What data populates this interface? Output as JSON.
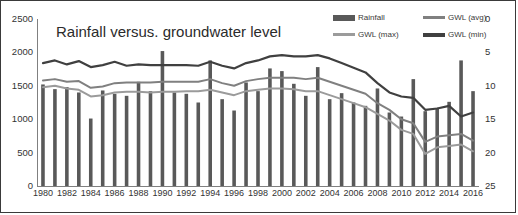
{
  "chart_data": {
    "type": "bar",
    "title": "Rainfall versus. groundwater level",
    "xlabel": "",
    "ylabel": "",
    "ylim": [
      0,
      2500
    ],
    "y2lim": [
      0,
      25
    ],
    "y2_inverted": true,
    "grid": false,
    "legend_position": "top-right",
    "y_ticks": [
      "0",
      "500",
      "1000",
      "1500",
      "2000",
      "2500"
    ],
    "y2_ticks": [
      "0",
      "5",
      "10",
      "15",
      "20",
      "25"
    ],
    "categories": [
      "1980",
      "1981",
      "1982",
      "1983",
      "1984",
      "1985",
      "1986",
      "1987",
      "1988",
      "1989",
      "1990",
      "1991",
      "1992",
      "1993",
      "1994",
      "1995",
      "1996",
      "1997",
      "1998",
      "1999",
      "2000",
      "2001",
      "2002",
      "2003",
      "2004",
      "2005",
      "2006",
      "2007",
      "2008",
      "2009",
      "2010",
      "2011",
      "2012",
      "2013",
      "2014",
      "2015",
      "2016"
    ],
    "tick_labels": [
      "1980",
      "1982",
      "1984",
      "1986",
      "1988",
      "1990",
      "1992",
      "1994",
      "1996",
      "1998",
      "2000",
      "2002",
      "2004",
      "2006",
      "2008",
      "2010",
      "2012",
      "2014",
      "2016"
    ],
    "series": [
      {
        "name": "Rainfall",
        "type": "bar",
        "axis": "left",
        "unit": "mm",
        "color": "#595959",
        "values": [
          1520,
          1450,
          1480,
          1400,
          1010,
          1430,
          1380,
          1350,
          1560,
          1420,
          2020,
          1400,
          1380,
          1250,
          1880,
          1300,
          1130,
          1550,
          1420,
          1760,
          1720,
          1530,
          1350,
          1780,
          1300,
          1390,
          1250,
          1200,
          1460,
          1100,
          1040,
          1600,
          1120,
          1170,
          1260,
          1880,
          1420
        ]
      },
      {
        "name": "GWL (avg)",
        "type": "line",
        "axis": "right",
        "unit": "m",
        "color": "#808080",
        "values": [
          9.2,
          9.0,
          9.4,
          9.3,
          10.3,
          10.1,
          9.6,
          9.5,
          9.5,
          9.5,
          9.4,
          9.4,
          9.4,
          9.4,
          9.0,
          9.6,
          10.0,
          9.3,
          9.0,
          8.8,
          8.8,
          8.8,
          9.0,
          8.8,
          9.4,
          10.0,
          10.6,
          11.2,
          12.6,
          13.6,
          15.0,
          15.6,
          18.4,
          17.6,
          17.4,
          17.2,
          18.2
        ]
      },
      {
        "name": "GWL (max)",
        "type": "line",
        "axis": "right",
        "unit": "m",
        "color": "#9b9b9b",
        "values": [
          10.2,
          10.0,
          10.4,
          10.6,
          11.6,
          11.4,
          11.0,
          10.9,
          10.9,
          11.0,
          10.9,
          10.9,
          10.8,
          10.8,
          10.6,
          11.0,
          11.4,
          10.8,
          10.6,
          10.4,
          10.4,
          10.5,
          10.8,
          10.8,
          11.4,
          12.0,
          12.6,
          13.2,
          14.2,
          15.2,
          16.6,
          17.2,
          20.2,
          19.2,
          19.0,
          18.8,
          19.8
        ]
      },
      {
        "name": "GWL (min)",
        "type": "line",
        "axis": "right",
        "unit": "m",
        "color": "#404040",
        "values": [
          6.6,
          6.2,
          6.8,
          6.3,
          7.2,
          6.9,
          6.4,
          7.0,
          6.8,
          6.9,
          6.9,
          6.9,
          6.9,
          7.0,
          6.4,
          7.0,
          7.4,
          6.6,
          6.2,
          5.6,
          5.4,
          5.6,
          5.6,
          5.4,
          5.9,
          6.6,
          7.3,
          8.0,
          9.6,
          11.0,
          11.6,
          11.8,
          13.6,
          13.4,
          13.0,
          14.6,
          14.0
        ]
      }
    ]
  },
  "legend": {
    "items": [
      {
        "label": "Rainfall",
        "marker": "bar",
        "color": "#595959"
      },
      {
        "label": "GWL (avg)",
        "marker": "line",
        "color": "#808080"
      },
      {
        "label": "GWL (max)",
        "marker": "line",
        "color": "#9b9b9b"
      },
      {
        "label": "GWL (min)",
        "marker": "line",
        "color": "#404040"
      }
    ]
  }
}
